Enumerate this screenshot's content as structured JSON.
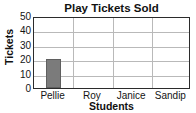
{
  "chart_data": {
    "type": "bar",
    "title": "Play Tickets Sold",
    "xlabel": "Students",
    "ylabel": "Tickets",
    "categories": [
      "Pellie",
      "Roy",
      "Janice",
      "Sandip"
    ],
    "values": [
      20,
      0,
      0,
      0
    ],
    "ylim": [
      0,
      50
    ],
    "yticks": [
      0,
      10,
      20,
      30,
      40,
      50
    ],
    "ytick_labels": [
      "0",
      "10",
      "20",
      "30",
      "40",
      "50"
    ],
    "grid": true,
    "legend": false,
    "bar_color": "#7b7b7b",
    "frame_color": "#2b2b2b",
    "grid_color": "#b9b9b9",
    "background": "#ffffff"
  }
}
